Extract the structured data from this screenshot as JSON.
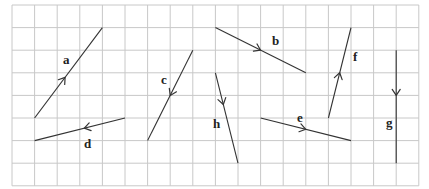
{
  "diagram": {
    "type": "vectors-on-square-grid",
    "grid": {
      "x0": 12,
      "y0": 5,
      "cell": 22.6,
      "cols": 18,
      "rows": 8,
      "line_color": "#c8c8c8"
    },
    "vector_color": "#333333",
    "vectors": [
      {
        "label": "a",
        "from": [
          1,
          5
        ],
        "to": [
          4,
          1
        ],
        "label_pos": [
          63,
          64
        ],
        "arrow_t": 0.45
      },
      {
        "label": "b",
        "from": [
          9,
          1
        ],
        "to": [
          13,
          3
        ],
        "label_pos": [
          272,
          45
        ],
        "arrow_t": 0.5
      },
      {
        "label": "c",
        "from": [
          8,
          2
        ],
        "to": [
          6,
          6
        ],
        "label_pos": [
          161,
          84
        ],
        "arrow_t": 0.5
      },
      {
        "label": "d",
        "from": [
          5,
          5
        ],
        "to": [
          1,
          6
        ],
        "label_pos": [
          84,
          148
        ],
        "arrow_t": 0.45
      },
      {
        "label": "e",
        "from": [
          11,
          5
        ],
        "to": [
          15,
          6
        ],
        "label_pos": [
          297,
          122
        ],
        "arrow_t": 0.5
      },
      {
        "label": "f",
        "from": [
          14,
          5
        ],
        "to": [
          15,
          1
        ],
        "label_pos": [
          353,
          61
        ],
        "arrow_t": 0.5
      },
      {
        "label": "g",
        "from": [
          17,
          2
        ],
        "to": [
          17,
          7
        ],
        "label_pos": [
          386,
          127
        ],
        "arrow_t": 0.4
      },
      {
        "label": "h",
        "from": [
          9,
          3
        ],
        "to": [
          10,
          7
        ],
        "label_pos": [
          213,
          128
        ],
        "arrow_t": 0.35
      }
    ]
  }
}
